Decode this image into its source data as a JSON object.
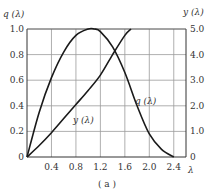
{
  "chart_data": {
    "type": "line",
    "title": "",
    "caption": "( a )",
    "xlabel": "λ",
    "ylabel_left": "q (λ)",
    "ylabel_right": "y (λ)",
    "x_ticks": [
      "0.4",
      "0.8",
      "1.2",
      "1.6",
      "2.0",
      "2.4"
    ],
    "x_tick_values": [
      0.4,
      0.8,
      1.2,
      1.6,
      2.0,
      2.4
    ],
    "y_left_ticks": [
      "0",
      "0.2",
      "0.4",
      "0.6",
      "0.8",
      "1.0"
    ],
    "y_left_values": [
      0,
      0.2,
      0.4,
      0.6,
      0.8,
      1.0
    ],
    "y_right_ticks": [
      "0",
      "1.0",
      "2.0",
      "3.0",
      "4.0",
      "5.0"
    ],
    "y_right_values": [
      0,
      1.0,
      2.0,
      3.0,
      4.0,
      5.0
    ],
    "origin_label": "0",
    "xlim": [
      0,
      2.6
    ],
    "ylim_left": [
      0,
      1.0
    ],
    "ylim_right": [
      0,
      5.0
    ],
    "grid": true,
    "series": [
      {
        "name": "q (λ)",
        "axis": "left",
        "label": "q (λ)",
        "x": [
          0,
          0.2,
          0.4,
          0.6,
          0.8,
          1.0,
          1.1,
          1.2,
          1.4,
          1.6,
          1.8,
          2.0,
          2.2,
          2.4
        ],
        "y": [
          0,
          0.35,
          0.62,
          0.82,
          0.95,
          1.0,
          1.0,
          0.98,
          0.86,
          0.66,
          0.4,
          0.18,
          0.06,
          0.0
        ]
      },
      {
        "name": "y (λ)",
        "axis": "right",
        "label": "y (λ)",
        "x": [
          0,
          0.2,
          0.4,
          0.6,
          0.8,
          1.0,
          1.2,
          1.4,
          1.6,
          1.7
        ],
        "y": [
          0,
          0.45,
          0.95,
          1.5,
          2.05,
          2.6,
          3.2,
          4.0,
          4.75,
          5.0
        ]
      }
    ]
  }
}
